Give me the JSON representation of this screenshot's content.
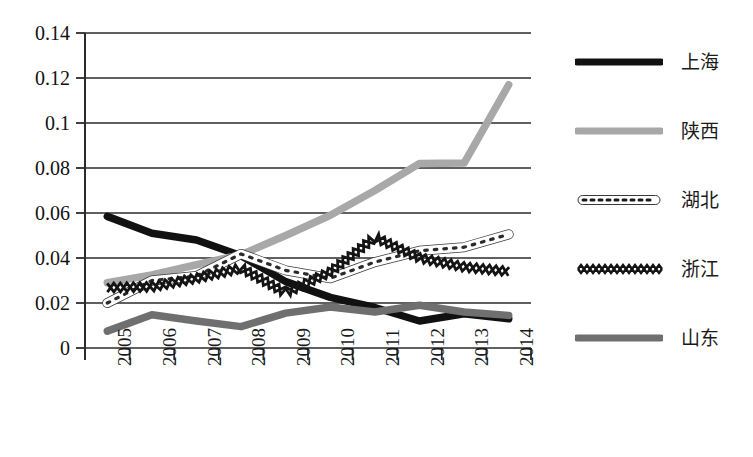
{
  "chart_data": {
    "type": "line",
    "title": "",
    "xlabel": "",
    "ylabel": "",
    "categories": [
      "2005",
      "2006",
      "2007",
      "2008",
      "2009",
      "2010",
      "2011",
      "2012",
      "2013",
      "2014"
    ],
    "ylim": [
      0,
      0.14
    ],
    "ytick_values": [
      0,
      0.02,
      0.04,
      0.06,
      0.08,
      0.1,
      0.12,
      0.14
    ],
    "ytick_labels": [
      "0",
      "0.02",
      "0.04",
      "0.06",
      "0.08",
      "0.1",
      "0.12",
      "0.14"
    ],
    "grid": true,
    "grid_axis": "y",
    "legend_position": "right",
    "series": [
      {
        "name": "上海",
        "style": "solid-thick-black",
        "color": "#111111",
        "values": [
          0.0585,
          0.051,
          0.048,
          0.041,
          0.0295,
          0.0225,
          0.018,
          0.012,
          0.0152,
          0.013
        ]
      },
      {
        "name": "陕西",
        "style": "solid-thick-lightgray",
        "color": "#a8a8a8",
        "values": [
          0.029,
          0.0325,
          0.037,
          0.0415,
          0.05,
          0.059,
          0.07,
          0.082,
          0.0822,
          0.117
        ]
      },
      {
        "name": "湖北",
        "style": "dotted-thin-outlined",
        "color": "#2a2a2a",
        "values": [
          0.02,
          0.03,
          0.032,
          0.0418,
          0.0345,
          0.031,
          0.0382,
          0.0432,
          0.0448,
          0.0505
        ]
      },
      {
        "name": "浙江",
        "style": "zigzag-xx",
        "color": "#141414",
        "values": [
          0.0268,
          0.0272,
          0.031,
          0.0355,
          0.0245,
          0.0338,
          0.0492,
          0.04,
          0.036,
          0.034
        ]
      },
      {
        "name": "山东",
        "style": "solid-thick-gray",
        "color": "#6f6f6f",
        "values": [
          0.0075,
          0.0148,
          0.012,
          0.0095,
          0.0155,
          0.0182,
          0.016,
          0.019,
          0.016,
          0.0145
        ]
      }
    ]
  },
  "legend": {
    "items": [
      {
        "label": "上海",
        "swatch": "legend-swatch-shanghai"
      },
      {
        "label": "陕西",
        "swatch": "legend-swatch-shaanxi"
      },
      {
        "label": "湖北",
        "swatch": "legend-swatch-hubei"
      },
      {
        "label": "浙江",
        "swatch": "legend-swatch-zhejiang"
      },
      {
        "label": "山东",
        "swatch": "legend-swatch-shandong"
      }
    ]
  }
}
